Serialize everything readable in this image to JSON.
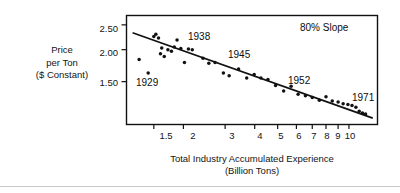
{
  "figure": {
    "background": "#ffffff",
    "ink_color": "#111111"
  },
  "axes": {
    "y_title_lines": [
      "Price",
      "per Ton",
      "($ Constant)"
    ],
    "x_title_lines": [
      "Total Industry Accumulated Experience",
      "(Billion Tons)"
    ],
    "y_ticks": [
      "2.50",
      "2.00",
      "1.50"
    ],
    "x_ticks": [
      "1.5",
      "2",
      "3",
      "4",
      "5",
      "6",
      "7",
      "8",
      "9",
      "10"
    ]
  },
  "annotations": {
    "slope": "80% Slope",
    "year_1929": "1929",
    "year_1938": "1938",
    "year_1945": "1945",
    "year_1952": "1952",
    "year_1971": "1971"
  },
  "chart_data": {
    "type": "scatter",
    "title": "",
    "subtitle": "",
    "xlabel": "Total Industry Accumulated Experience (Billion Tons)",
    "ylabel": "Price per Ton ($ Constant)",
    "xscale": "log",
    "yscale": "log",
    "xlim": [
      1.15,
      13.2
    ],
    "ylim": [
      1.02,
      2.72
    ],
    "xtick_values": [
      1.5,
      2,
      3,
      4,
      5,
      6,
      7,
      8,
      9,
      10
    ],
    "xtick_labels": [
      "1.5",
      "2",
      "3",
      "4",
      "5",
      "6",
      "7",
      "8",
      "9",
      "10"
    ],
    "ytick_values": [
      2.5,
      2.0,
      1.5
    ],
    "ytick_labels": [
      "2.50",
      "2.00",
      "1.50"
    ],
    "grid": false,
    "legend": "none",
    "annotations": [
      {
        "text": "80% Slope",
        "x": 6.6,
        "y": 2.52
      },
      {
        "text": "1929",
        "x": 1.33,
        "y": 1.52
      },
      {
        "text": "1938",
        "x": 2.38,
        "y": 2.43
      },
      {
        "text": "1945",
        "x": 3.35,
        "y": 2.05
      },
      {
        "text": "1952",
        "x": 6.6,
        "y": 1.53
      },
      {
        "text": "1971",
        "x": 11.9,
        "y": 1.27
      }
    ],
    "series": [
      {
        "name": "Price per ton vs accumulated experience",
        "marker": "filled-circle",
        "points": [
          {
            "year": 1929,
            "x": 1.3,
            "y": 1.83
          },
          {
            "year": 1930,
            "x": 1.42,
            "y": 1.62
          },
          {
            "year": 1931,
            "x": 1.5,
            "y": 2.25
          },
          {
            "year": 1932,
            "x": 1.53,
            "y": 2.3
          },
          {
            "year": 1933,
            "x": 1.57,
            "y": 2.22
          },
          {
            "year": 1934,
            "x": 1.6,
            "y": 1.93
          },
          {
            "year": 1935,
            "x": 1.62,
            "y": 2.03
          },
          {
            "year": 1936,
            "x": 1.66,
            "y": 1.88
          },
          {
            "year": 1937,
            "x": 1.72,
            "y": 2.0
          },
          {
            "year": 1938,
            "x": 1.78,
            "y": 1.97
          },
          {
            "year": 1939,
            "x": 1.83,
            "y": 2.05
          },
          {
            "year": 1940,
            "x": 1.88,
            "y": 2.18
          },
          {
            "year": 1941,
            "x": 1.95,
            "y": 2.02
          },
          {
            "year": 1942,
            "x": 2.02,
            "y": 1.78
          },
          {
            "year": 1943,
            "x": 2.1,
            "y": 2.01
          },
          {
            "year": 1944,
            "x": 2.18,
            "y": 2.0
          },
          {
            "year": 1945,
            "x": 2.42,
            "y": 1.85
          },
          {
            "year": 1946,
            "x": 2.56,
            "y": 1.77
          },
          {
            "year": 1947,
            "x": 2.72,
            "y": 1.78
          },
          {
            "year": 1948,
            "x": 2.95,
            "y": 1.62
          },
          {
            "year": 1949,
            "x": 3.12,
            "y": 1.58
          },
          {
            "year": 1950,
            "x": 3.42,
            "y": 1.68
          },
          {
            "year": 1951,
            "x": 3.7,
            "y": 1.55
          },
          {
            "year": 1952,
            "x": 3.98,
            "y": 1.6
          },
          {
            "year": 1953,
            "x": 4.25,
            "y": 1.55
          },
          {
            "year": 1954,
            "x": 4.55,
            "y": 1.53
          },
          {
            "year": 1955,
            "x": 4.9,
            "y": 1.45
          },
          {
            "year": 1956,
            "x": 5.3,
            "y": 1.38
          },
          {
            "year": 1957,
            "x": 5.7,
            "y": 1.44
          },
          {
            "year": 1958,
            "x": 6.1,
            "y": 1.34
          },
          {
            "year": 1959,
            "x": 6.55,
            "y": 1.32
          },
          {
            "year": 1960,
            "x": 7.0,
            "y": 1.3
          },
          {
            "year": 1961,
            "x": 7.5,
            "y": 1.27
          },
          {
            "year": 1962,
            "x": 8.0,
            "y": 1.31
          },
          {
            "year": 1963,
            "x": 8.5,
            "y": 1.26
          },
          {
            "year": 1964,
            "x": 9.0,
            "y": 1.25
          },
          {
            "year": 1965,
            "x": 9.45,
            "y": 1.23
          },
          {
            "year": 1966,
            "x": 9.9,
            "y": 1.22
          },
          {
            "year": 1967,
            "x": 10.3,
            "y": 1.21
          },
          {
            "year": 1968,
            "x": 10.7,
            "y": 1.19
          },
          {
            "year": 1969,
            "x": 11.05,
            "y": 1.15
          },
          {
            "year": 1970,
            "x": 11.4,
            "y": 1.13
          },
          {
            "year": 1971,
            "x": 11.75,
            "y": 1.12
          }
        ]
      }
    ],
    "trendline": {
      "name": "80% experience curve",
      "x_start": 1.22,
      "y_start": 2.33,
      "x_end": 12.6,
      "y_end": 1.08
    }
  }
}
